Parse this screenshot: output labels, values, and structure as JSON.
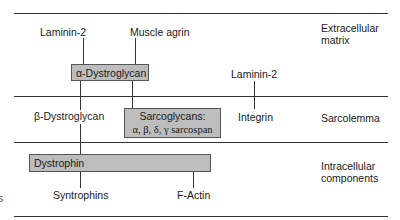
{
  "zones": {
    "extracellular": [
      "Extracellular",
      "matrix"
    ],
    "sarcolemma": "Sarcolemma",
    "intracellular": [
      "Intracellular",
      "components"
    ]
  },
  "labels": {
    "laminin_top": "Laminin-2",
    "muscle_agrin": "Muscle agrin",
    "laminin_right": "Laminin-2",
    "beta_dystroglycan": "β-Dystroglycan",
    "integrin": "Integrin",
    "syntrophins": "Syntrophins",
    "f_actin": "F-Actin",
    "edge_fragment": "s"
  },
  "boxes": {
    "alpha_dystroglycan": "α-Dystroglycan",
    "sarcoglycans_line1": "Sarcoglycans:",
    "sarcoglycans_line2": "α, β, δ, γ sarcospan",
    "dystrophin": "Dystrophin"
  },
  "colors": {
    "box_fill": "#bdbdbd",
    "line": "#333333"
  }
}
